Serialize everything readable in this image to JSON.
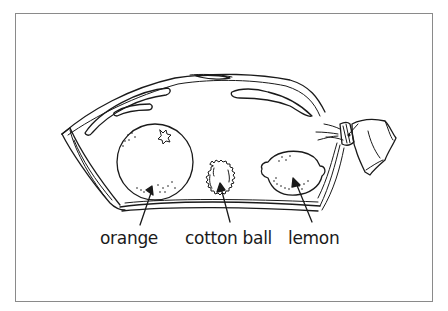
{
  "figure": {
    "colors": {
      "ink": "#1a1a1a",
      "frame_border": "#8a8a8a",
      "background": "#ffffff"
    },
    "objects": [
      {
        "id": "bag",
        "icon": "plastic-bag-icon"
      },
      {
        "id": "orange",
        "icon": "orange-icon"
      },
      {
        "id": "cotton-ball",
        "icon": "cotton-ball-icon"
      },
      {
        "id": "lemon",
        "icon": "lemon-icon"
      },
      {
        "id": "tie",
        "icon": "twist-tie-icon"
      }
    ],
    "labels": [
      {
        "text": "orange",
        "points_to": "orange"
      },
      {
        "text": "cotton ball",
        "points_to": "cotton-ball"
      },
      {
        "text": "lemon",
        "points_to": "lemon"
      }
    ]
  }
}
